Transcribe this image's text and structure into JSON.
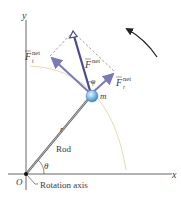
{
  "diagram": {
    "type": "physics-vector-diagram",
    "axes": {
      "x_label": "x",
      "y_label": "y",
      "origin_label": "O"
    },
    "labels": {
      "rotation_axis": "Rotation axis",
      "rod": "Rod",
      "radius": "r",
      "theta": "θ",
      "phi": "φ",
      "mass": "m",
      "F_sym": "F",
      "net_sup": "net",
      "tangential_sub": "t",
      "radial_sub": "r"
    },
    "vectors": [
      {
        "name": "F_net",
        "label": "F net",
        "color": "#4a4a8c"
      },
      {
        "name": "F_t_net",
        "label": "F t net",
        "color": "#7a7ab8"
      },
      {
        "name": "F_r_net",
        "label": "F r net",
        "color": "#7a7ab8"
      }
    ],
    "colors": {
      "axis": "#555555",
      "rod": "#666666",
      "arc": "#e6dcb0",
      "ball": "#7fbde6",
      "dashed": "#777777",
      "rotation_arrow": "#222222"
    }
  }
}
